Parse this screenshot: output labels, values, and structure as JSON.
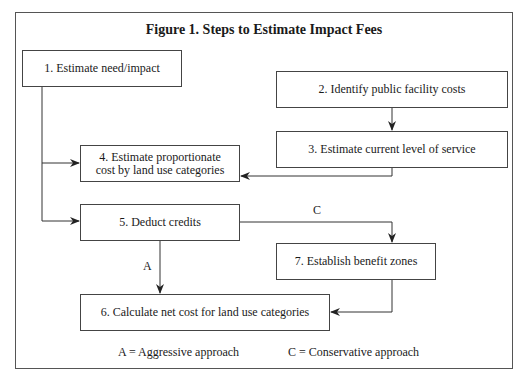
{
  "figure": {
    "title": "Figure 1. Steps to Estimate Impact Fees",
    "steps": [
      {
        "id": 1,
        "label": "1. Estimate need/impact"
      },
      {
        "id": 2,
        "label": "2. Identify public facility costs"
      },
      {
        "id": 3,
        "label": "3. Estimate current level of service"
      },
      {
        "id": 4,
        "label_line1": "4. Estimate proportionate",
        "label_line2": "cost by land use categories"
      },
      {
        "id": 5,
        "label": "5. Deduct credits"
      },
      {
        "id": 6,
        "label": "6. Calculate net cost for land use categories"
      },
      {
        "id": 7,
        "label": "7. Establish benefit zones"
      }
    ],
    "edges": [
      {
        "from": 1,
        "to": 4
      },
      {
        "from": 1,
        "to": 5
      },
      {
        "from": 2,
        "to": 3
      },
      {
        "from": 3,
        "to": 4
      },
      {
        "from": 5,
        "to": 6,
        "label": "A"
      },
      {
        "from": 5,
        "to": 7,
        "label": "C"
      },
      {
        "from": 7,
        "to": 6
      }
    ],
    "path_labels": {
      "a": "A",
      "c": "C"
    },
    "legend": {
      "a": "A = Aggressive approach",
      "c": "C = Conservative approach"
    }
  }
}
